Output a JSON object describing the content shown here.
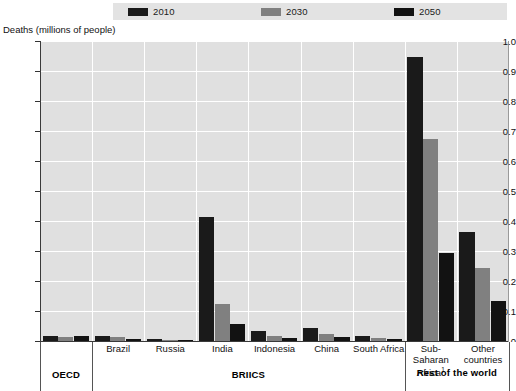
{
  "legend": {
    "items": [
      {
        "label": "2010",
        "color": "#1a1a1a"
      },
      {
        "label": "2030",
        "color": "#808080"
      },
      {
        "label": "2050",
        "color": "#121212"
      }
    ]
  },
  "axis": {
    "y_title": "Deaths (millions of people)",
    "y_ticks": [
      "1.0",
      "0.9",
      "0.8",
      "0.7",
      "0.6",
      "0.5",
      "0.4",
      "0.3",
      "0.2",
      "0.1",
      "0"
    ]
  },
  "groups": [
    {
      "name": "OECD",
      "label": "OECD"
    },
    {
      "name": "BRIICS",
      "label": "BRIICS"
    },
    {
      "name": "Rest of the world",
      "label": "Rest of the world"
    }
  ],
  "categories_display": [
    {
      "line1": "",
      "line2": ""
    },
    {
      "line1": "Brazil",
      "line2": ""
    },
    {
      "line1": "Russia",
      "line2": ""
    },
    {
      "line1": "India",
      "line2": ""
    },
    {
      "line1": "Indonesia",
      "line2": ""
    },
    {
      "line1": "China",
      "line2": ""
    },
    {
      "line1": "South Africa",
      "line2": ""
    },
    {
      "line1": "Sub-Saharan",
      "line2": "Africa",
      "footnote": "1"
    },
    {
      "line1": "Other",
      "line2": "countries"
    }
  ],
  "chart_data": {
    "type": "bar",
    "title": "",
    "xlabel": "",
    "ylabel": "Deaths (millions of people)",
    "ylim": [
      0,
      1.0
    ],
    "ytick_step": 0.1,
    "grid": true,
    "legend_position": "top",
    "categories": [
      "OECD",
      "Brazil",
      "Russia",
      "India",
      "Indonesia",
      "China",
      "South Africa",
      "Sub-Saharan Africa",
      "Other countries"
    ],
    "series": [
      {
        "name": "2010",
        "color": "#1a1a1a",
        "values": [
          0.018,
          0.016,
          0.008,
          0.412,
          0.035,
          0.045,
          0.016,
          0.948,
          0.365
        ]
      },
      {
        "name": "2030",
        "color": "#808080",
        "values": [
          0.014,
          0.012,
          0.004,
          0.125,
          0.018,
          0.022,
          0.01,
          0.675,
          0.245
        ]
      },
      {
        "name": "2050",
        "color": "#121212",
        "values": [
          0.016,
          0.006,
          0.002,
          0.056,
          0.01,
          0.012,
          0.007,
          0.295,
          0.135
        ]
      }
    ]
  }
}
